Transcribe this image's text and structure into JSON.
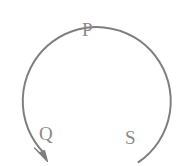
{
  "figure": {
    "background_color": "#ffffff",
    "stroke_color": "#7f7f7f",
    "label_color": "#8a8a8a",
    "stroke_width": 2,
    "arc": {
      "shape": "open circle",
      "center_x": 88,
      "center_y": 88,
      "radius": 74,
      "start_angle_deg": 47,
      "sweep_deg": 302,
      "direction": "counterclockwise",
      "gap_position": "bottom"
    },
    "arrow": {
      "name": "arrowhead",
      "position": "bottom-left end of arc",
      "tip_x": 47,
      "tip_y": 161,
      "direction": "down-right",
      "indicates": "counterclockwise motion"
    },
    "labels": [
      {
        "id": "P",
        "text": "P",
        "position": "top",
        "x": 89,
        "y": 30
      },
      {
        "id": "Q",
        "text": "Q",
        "position": "bottom-left",
        "x": 46,
        "y": 135
      },
      {
        "id": "S",
        "text": "S",
        "position": "bottom-right",
        "x": 130,
        "y": 137
      }
    ]
  }
}
